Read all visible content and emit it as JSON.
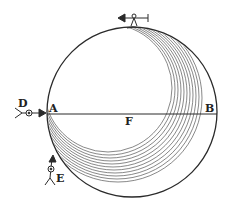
{
  "figure": {
    "type": "woodcut-globe-diagram",
    "labels": {
      "A": "A",
      "B": "B",
      "D": "D",
      "E": "E",
      "F": "F"
    },
    "colors": {
      "ink": "#2a2a2a",
      "hatch": "#555555",
      "background": "#ffffff"
    },
    "circle": {
      "cx": 132,
      "cy": 112,
      "r": 85
    },
    "diameter_line": {
      "from": "A",
      "to": "B",
      "y": 114
    },
    "figures": [
      {
        "name": "observer-top",
        "position": "top of globe",
        "arrow_direction": "left"
      },
      {
        "name": "observer-D",
        "position": "left of A",
        "arrow_direction": "right"
      },
      {
        "name": "observer-E",
        "position": "lower left of globe",
        "arrow_direction": "up"
      }
    ]
  }
}
